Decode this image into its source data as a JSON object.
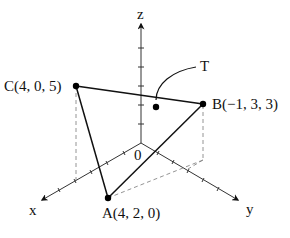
{
  "diagram": {
    "type": "3d-coordinate-triangle",
    "axes": {
      "x_label": "x",
      "y_label": "y",
      "z_label": "z",
      "origin_label": "0"
    },
    "points": [
      {
        "name": "A",
        "coords": [
          4,
          2,
          0
        ],
        "label": "A(4, 2, 0)"
      },
      {
        "name": "B",
        "coords": [
          -1,
          3,
          3
        ],
        "label": "B(−1, 3, 3)"
      },
      {
        "name": "C",
        "coords": [
          4,
          0,
          5
        ],
        "label": "C(4, 0, 5)"
      }
    ],
    "triangle_label": "T",
    "colors": {
      "ink": "#111111",
      "axis": "#333333",
      "dashed": "#888888",
      "background": "#ffffff"
    }
  }
}
